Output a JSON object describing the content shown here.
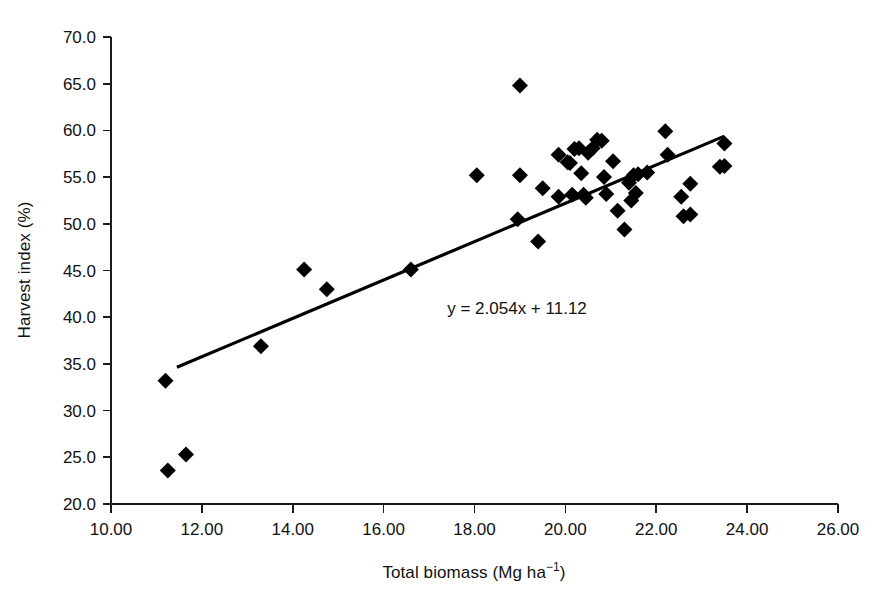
{
  "chart_data": {
    "type": "scatter",
    "title": "",
    "xlabel": "Total biomass (Mg ha−1)",
    "ylabel": "Harvest index (%)",
    "xlabel_parts": {
      "base": "Total biomass (Mg ha",
      "exponent": "−1",
      "tail": ")"
    },
    "xlim": [
      10.0,
      26.0
    ],
    "ylim": [
      20.0,
      70.0
    ],
    "xticks": [
      "10.00",
      "12.00",
      "14.00",
      "16.00",
      "18.00",
      "20.00",
      "22.00",
      "24.00",
      "26.00"
    ],
    "xtick_values": [
      10.0,
      12.0,
      14.0,
      16.0,
      18.0,
      20.0,
      22.0,
      24.0,
      26.0
    ],
    "yticks": [
      "20.0",
      "25.0",
      "30.0",
      "35.0",
      "40.0",
      "45.0",
      "50.0",
      "55.0",
      "60.0",
      "65.0",
      "70.0"
    ],
    "ytick_values": [
      20.0,
      25.0,
      30.0,
      35.0,
      40.0,
      45.0,
      50.0,
      55.0,
      60.0,
      65.0,
      70.0
    ],
    "grid": false,
    "legend": false,
    "marker_style": "filled-diamond",
    "marker_color": "#000000",
    "annotations": [
      {
        "text": "y = 2.054x + 11.12",
        "x": 17.4,
        "y": 40.3,
        "name": "regression-equation"
      }
    ],
    "trendline": {
      "type": "linear",
      "slope": 2.054,
      "intercept": 11.12,
      "x_start": 11.45,
      "x_end": 23.5,
      "color": "#000000"
    },
    "points": [
      {
        "x": 11.25,
        "y": 23.6
      },
      {
        "x": 11.65,
        "y": 25.3
      },
      {
        "x": 11.2,
        "y": 33.2
      },
      {
        "x": 13.3,
        "y": 36.9
      },
      {
        "x": 14.25,
        "y": 45.1
      },
      {
        "x": 14.75,
        "y": 43.0
      },
      {
        "x": 16.6,
        "y": 45.1
      },
      {
        "x": 18.05,
        "y": 55.2
      },
      {
        "x": 19.0,
        "y": 64.8
      },
      {
        "x": 19.0,
        "y": 55.2
      },
      {
        "x": 18.95,
        "y": 50.5
      },
      {
        "x": 19.4,
        "y": 48.1
      },
      {
        "x": 19.5,
        "y": 53.8
      },
      {
        "x": 19.85,
        "y": 57.4
      },
      {
        "x": 19.85,
        "y": 52.9
      },
      {
        "x": 20.05,
        "y": 56.6
      },
      {
        "x": 20.1,
        "y": 56.5
      },
      {
        "x": 20.15,
        "y": 53.1
      },
      {
        "x": 20.2,
        "y": 58.0
      },
      {
        "x": 20.3,
        "y": 58.1
      },
      {
        "x": 20.35,
        "y": 55.4
      },
      {
        "x": 20.4,
        "y": 53.1
      },
      {
        "x": 20.45,
        "y": 52.8
      },
      {
        "x": 20.5,
        "y": 57.6
      },
      {
        "x": 20.6,
        "y": 58.1
      },
      {
        "x": 20.7,
        "y": 59.0
      },
      {
        "x": 20.8,
        "y": 58.9
      },
      {
        "x": 20.85,
        "y": 55.0
      },
      {
        "x": 20.9,
        "y": 53.2
      },
      {
        "x": 21.05,
        "y": 56.7
      },
      {
        "x": 21.15,
        "y": 51.4
      },
      {
        "x": 21.3,
        "y": 49.4
      },
      {
        "x": 21.4,
        "y": 54.4
      },
      {
        "x": 21.45,
        "y": 52.5
      },
      {
        "x": 21.5,
        "y": 55.2
      },
      {
        "x": 21.55,
        "y": 53.3
      },
      {
        "x": 21.6,
        "y": 55.3
      },
      {
        "x": 21.8,
        "y": 55.5
      },
      {
        "x": 22.2,
        "y": 59.9
      },
      {
        "x": 22.25,
        "y": 57.4
      },
      {
        "x": 22.55,
        "y": 52.9
      },
      {
        "x": 22.6,
        "y": 50.8
      },
      {
        "x": 22.75,
        "y": 51.0
      },
      {
        "x": 22.75,
        "y": 54.3
      },
      {
        "x": 23.4,
        "y": 56.1
      },
      {
        "x": 23.5,
        "y": 56.2
      },
      {
        "x": 23.5,
        "y": 58.6
      }
    ]
  }
}
